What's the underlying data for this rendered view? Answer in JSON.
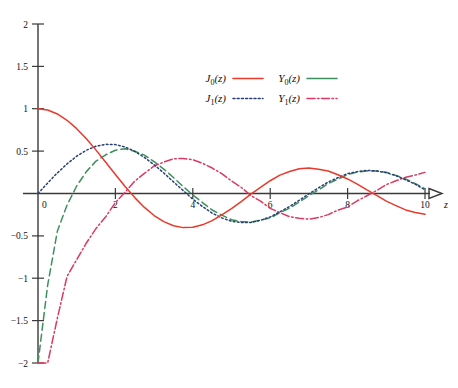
{
  "figure": {
    "title": "",
    "background_color": "#ffffff"
  },
  "axes": {
    "x_label": "z",
    "y_label": "",
    "x_ticks": [
      "0",
      "2",
      "4",
      "6",
      "8",
      "10"
    ],
    "y_ticks": [
      "2",
      "1.5",
      "1",
      "0.5",
      "−0.5",
      "−1",
      "−1.5",
      "−2"
    ],
    "x_origin_label": "0",
    "arrow_head": "x-axis-arrow"
  },
  "legend": {
    "entries": [
      {
        "label": "J",
        "sub": "0",
        "arg": "(z)",
        "name": "J0(z)",
        "color": "#e8392b",
        "dash": "solid",
        "dasharray": ""
      },
      {
        "label": "Y",
        "sub": "0",
        "arg": "(z)",
        "name": "Y0(z)",
        "color": "#3f8f5e",
        "dash": "solid",
        "dasharray": ""
      },
      {
        "label": "J",
        "sub": "1",
        "arg": "(z)",
        "name": "J1(z)",
        "color": "#2b3f77",
        "dash": "dotted",
        "dasharray": "1.6,2.4"
      },
      {
        "label": "Y",
        "sub": "1",
        "arg": "(z)",
        "name": "Y1(z)",
        "color": "#da3a63",
        "dash": "dashdot",
        "dasharray": "7,2.5,1.5,2.5"
      }
    ]
  },
  "chart_data": {
    "type": "line",
    "title": "",
    "xlabel": "z",
    "ylabel": "",
    "xlim": [
      0,
      10
    ],
    "ylim": [
      -2,
      2
    ],
    "xticks": [
      0,
      2,
      4,
      6,
      8,
      10
    ],
    "yticks": [
      -2,
      -1.5,
      -1,
      -0.5,
      0,
      0.5,
      1,
      1.5,
      2
    ],
    "grid": false,
    "legend_position": "upper-center",
    "x": [
      0,
      0.25,
      0.5,
      0.75,
      1,
      1.25,
      1.5,
      1.75,
      2,
      2.25,
      2.5,
      2.75,
      3,
      3.25,
      3.5,
      3.75,
      4,
      4.25,
      4.5,
      4.75,
      5,
      5.25,
      5.5,
      5.75,
      6,
      6.25,
      6.5,
      6.75,
      7,
      7.25,
      7.5,
      7.75,
      8,
      8.25,
      8.5,
      8.75,
      9,
      9.25,
      9.5,
      9.75,
      10
    ],
    "series": [
      {
        "name": "J0(z)",
        "color": "#e8392b",
        "linestyle": "solid",
        "values": [
          1.0,
          0.9844,
          0.9385,
          0.8642,
          0.7652,
          0.6459,
          0.5118,
          0.369,
          0.2239,
          0.0827,
          -0.0484,
          -0.1641,
          -0.2601,
          -0.3325,
          -0.3801,
          -0.4026,
          -0.3971,
          -0.3698,
          -0.3205,
          -0.2526,
          -0.1776,
          -0.0968,
          -0.0068,
          0.0717,
          0.1506,
          0.2174,
          0.2601,
          0.2921,
          0.3001,
          0.2851,
          0.2663,
          0.2211,
          0.1717,
          0.1103,
          0.0419,
          -0.0225,
          -0.0903,
          -0.1424,
          -0.1939,
          -0.2243,
          -0.2459
        ]
      },
      {
        "name": "Y0(z)",
        "color": "#3f8f5e",
        "linestyle": "dashed",
        "values": [
          -2.0,
          -1.0811,
          -0.4445,
          -0.1372,
          0.0883,
          0.2582,
          0.3824,
          0.4568,
          0.5104,
          0.5287,
          0.4981,
          0.4529,
          0.3769,
          0.2882,
          0.189,
          0.083,
          -0.0169,
          -0.1068,
          -0.1947,
          -0.2556,
          -0.3085,
          -0.3314,
          -0.3395,
          -0.3146,
          -0.2882,
          -0.2276,
          -0.1732,
          -0.1,
          -0.0259,
          0.042,
          0.1173,
          0.1705,
          0.2235,
          0.2516,
          0.2655,
          0.2646,
          0.2499,
          0.2136,
          0.1712,
          0.1162,
          0.0557
        ]
      },
      {
        "name": "J1(z)",
        "color": "#2b3f77",
        "linestyle": "dotted",
        "values": [
          0.0,
          0.124,
          0.2423,
          0.3492,
          0.4401,
          0.5106,
          0.5579,
          0.5802,
          0.5767,
          0.5484,
          0.4971,
          0.4258,
          0.3391,
          0.2423,
          0.1374,
          0.0348,
          -0.066,
          -0.1538,
          -0.2311,
          -0.2879,
          -0.3276,
          -0.3414,
          -0.3414,
          -0.3158,
          -0.2767,
          -0.2163,
          -0.1538,
          -0.0799,
          -0.0047,
          0.0671,
          0.1352,
          0.1864,
          0.2346,
          0.258,
          0.2731,
          0.2657,
          0.2453,
          0.2091,
          0.1613,
          0.109,
          0.0435
        ]
      },
      {
        "name": "Y1(z)",
        "color": "#da3a63",
        "linestyle": "dashdot",
        "values": [
          -2.0,
          -2.0,
          -1.4715,
          -0.9781,
          -0.7812,
          -0.5837,
          -0.4123,
          -0.274,
          -0.107,
          0.0152,
          0.1459,
          0.2376,
          0.3247,
          0.3707,
          0.4102,
          0.4141,
          0.3979,
          0.3566,
          0.301,
          0.2336,
          0.1479,
          0.0736,
          -0.0238,
          -0.0904,
          -0.175,
          -0.2252,
          -0.2741,
          -0.2915,
          -0.3027,
          -0.2834,
          -0.249,
          -0.196,
          -0.1581,
          -0.0858,
          -0.0262,
          0.0358,
          0.1043,
          0.1504,
          0.1916,
          0.2179,
          0.249
        ]
      }
    ]
  }
}
